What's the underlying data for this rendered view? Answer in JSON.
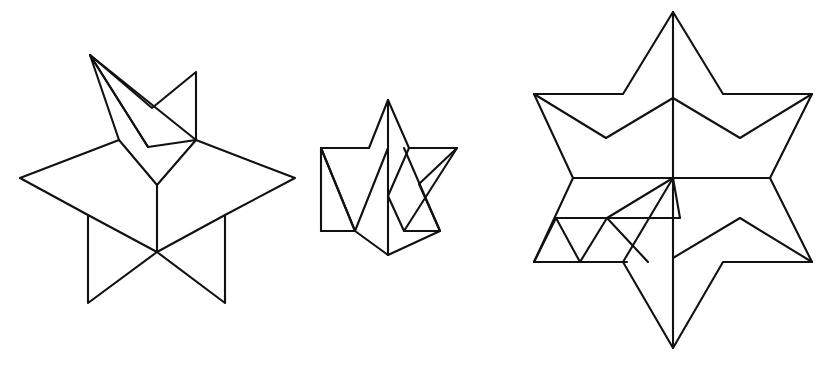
{
  "page": {
    "background_color": "#ffffff",
    "stroke_color": "#111111",
    "width": 831,
    "height": 365,
    "figure_count": 3
  },
  "figures": [
    {
      "id": "left-star",
      "name": "five-pointed-star-partially-folded",
      "label": "Left figure: five-pointed star with folded upper point",
      "stroke_width": 2.1,
      "paths": [
        {
          "name": "star-outline",
          "d": "M 90 55 L 119 140 L 20 178 L 88 215 L 88 303 L 157 252 L 225 303 L 225 215 L 295 178 L 196 140 Z",
          "closed": true
        },
        {
          "name": "fold-crease-upper-left",
          "d": "M 90 55 L 148 147",
          "closed": false
        },
        {
          "name": "fold-flap-upper",
          "d": "M 90 55 L 152 108 L 196 72 L 196 140 L 148 147 Z",
          "closed": true
        },
        {
          "name": "fold-crease-center-left",
          "d": "M 119 140 L 157 185",
          "closed": false
        },
        {
          "name": "fold-crease-center-right",
          "d": "M 196 140 L 157 185",
          "closed": false
        },
        {
          "name": "fold-crease-vertical-center",
          "d": "M 157 185 L 157 252",
          "closed": false
        },
        {
          "name": "fold-crease-lower-left",
          "d": "M 88 215 L 157 252",
          "closed": false
        },
        {
          "name": "fold-crease-lower-right",
          "d": "M 225 215 L 157 252",
          "closed": false
        }
      ]
    },
    {
      "id": "middle-star",
      "name": "six-pointed-star-collapsed",
      "label": "Middle figure: small collapsed six-pointed star",
      "stroke_width": 2.1,
      "paths": [
        {
          "name": "star-outline",
          "d": "M 388 100 L 409 148 L 457 148 L 419 184 L 440 231 L 388 255 L 355 231 L 321 148 L 369 148 Z",
          "closed": true
        },
        {
          "name": "left-triangle-lower",
          "d": "M 321 148 L 355 231 L 388 148",
          "closed": false
        },
        {
          "name": "right-triangle-lower",
          "d": "M 457 148 L 404 231 L 388 196",
          "closed": false
        },
        {
          "name": "right-triangle-upper",
          "d": "M 404 148 L 440 231",
          "closed": false
        },
        {
          "name": "right-lower-horizontal",
          "d": "M 404 231 L 440 231",
          "closed": false
        },
        {
          "name": "left-lower-horizontal",
          "d": "M 321 231 L 355 231",
          "closed": false
        },
        {
          "name": "left-outer-edge",
          "d": "M 321 148 L 321 231",
          "closed": false
        },
        {
          "name": "fold-crease-vertical-center",
          "d": "M 388 100 L 388 255",
          "closed": false
        },
        {
          "name": "fold-crease-diagonal",
          "d": "M 388 196 L 409 148",
          "closed": false
        }
      ]
    },
    {
      "id": "right-star",
      "name": "six-pointed-star-unfolded",
      "label": "Right figure: large six-pointed star with internal creases",
      "stroke_width": 2.1,
      "paths": [
        {
          "name": "star-outline",
          "d": "M 673 12 L 723 94 L 812 94 L 770 178 L 812 262 L 723 262 L 673 348 L 623 262 L 534 262 L 573 178 L 534 94 L 623 94 Z",
          "closed": true
        },
        {
          "name": "fold-crease-vertical",
          "d": "M 673 12 L 673 348",
          "closed": false
        },
        {
          "name": "fold-crease-horizontal",
          "d": "M 573 178 L 770 178",
          "closed": false
        },
        {
          "name": "upper-chevron-left",
          "d": "M 534 94 L 606 138 L 673 98",
          "closed": false
        },
        {
          "name": "upper-chevron-right",
          "d": "M 812 94 L 740 138 L 673 98",
          "closed": false
        },
        {
          "name": "lower-chevron-right",
          "d": "M 812 262 L 740 218 L 673 258",
          "closed": false
        },
        {
          "name": "lower-chevron-left-partial",
          "d": "M 673 178 L 623 262",
          "closed": false
        },
        {
          "name": "inner-detail-diagonal",
          "d": "M 673 178 L 607 218",
          "closed": false
        },
        {
          "name": "inner-detail-ridge",
          "d": "M 607 218 L 680 218 L 673 178",
          "closed": false
        },
        {
          "name": "inner-detail-horizontal",
          "d": "M 556 218 L 680 218",
          "closed": false
        },
        {
          "name": "inner-detail-lower-horizontal",
          "d": "M 534 262 L 627 262",
          "closed": false
        },
        {
          "name": "inner-detail-left-v",
          "d": "M 556 218 L 580 262",
          "closed": false
        },
        {
          "name": "inner-detail-mid-v",
          "d": "M 607 218 L 580 262",
          "closed": false
        },
        {
          "name": "inner-detail-right-v",
          "d": "M 607 218 L 648 262",
          "closed": false
        },
        {
          "name": "inner-detail-left-edge",
          "d": "M 534 262 L 556 218",
          "closed": false
        }
      ]
    }
  ]
}
